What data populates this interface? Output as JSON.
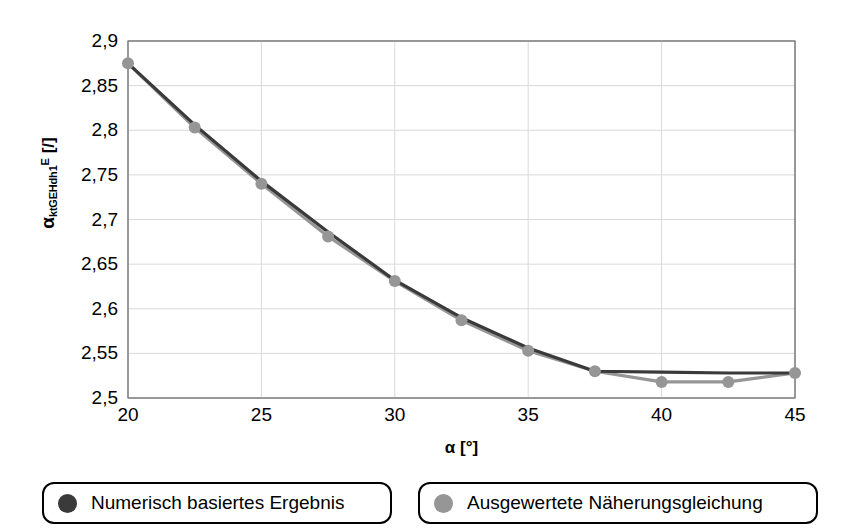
{
  "chart_data": {
    "type": "line",
    "title": "",
    "xlabel": "α [°]",
    "ylabel": "α_ktGEHdh1^E [/]",
    "ylabel_parts": {
      "base": "α",
      "sub": "ktGEHdh1",
      "sup": "E",
      "unit": " [/]"
    },
    "xlabel_parts": {
      "base": "α",
      "unit": " [°]"
    },
    "x": [
      20,
      22.5,
      25,
      27.5,
      30,
      32.5,
      35,
      37.5,
      40,
      42.5,
      45
    ],
    "xlim": [
      20,
      45
    ],
    "ylim": [
      2.5,
      2.9
    ],
    "xticks": [
      20,
      25,
      30,
      35,
      40,
      45
    ],
    "xtick_labels": [
      "20",
      "25",
      "30",
      "35",
      "40",
      "45"
    ],
    "yticks": [
      2.5,
      2.55,
      2.6,
      2.65,
      2.7,
      2.75,
      2.8,
      2.85,
      2.9
    ],
    "ytick_labels": [
      "2,5",
      "2,55",
      "2,6",
      "2,65",
      "2,7",
      "2,75",
      "2,8",
      "2,85",
      "2,9"
    ],
    "grid": true,
    "legend_position": "below",
    "series": [
      {
        "name": "Numerisch basiertes Ergebnis",
        "color": "#3a3a3a",
        "marker": "circle",
        "marker_visible": false,
        "values": [
          2.875,
          2.806,
          2.743,
          2.686,
          2.632,
          2.59,
          2.556,
          2.53,
          2.529,
          2.528,
          2.528
        ]
      },
      {
        "name": "Ausgewertete Näherungsgleichung",
        "color": "#969696",
        "marker": "circle",
        "marker_visible": true,
        "values": [
          2.875,
          2.803,
          2.74,
          2.681,
          2.631,
          2.587,
          2.553,
          2.53,
          2.518,
          2.518,
          2.528
        ]
      }
    ]
  },
  "legend": {
    "items": [
      {
        "label": "Numerisch basiertes Ergebnis",
        "color": "#3a3a3a"
      },
      {
        "label": "Ausgewertete Näherungsgleichung",
        "color": "#969696"
      }
    ]
  },
  "colors": {
    "axis": "#7f7f7f",
    "grid": "#d9d9d9",
    "series_dark": "#3a3a3a",
    "series_gray": "#969696",
    "background": "#ffffff"
  }
}
